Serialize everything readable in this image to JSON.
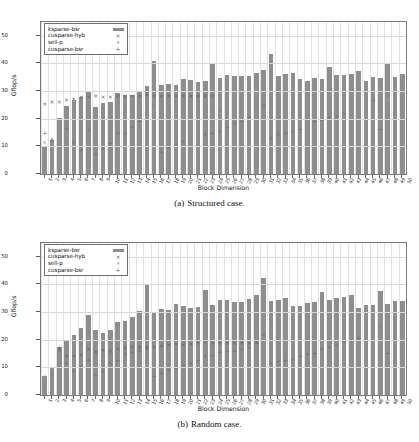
{
  "figure": {
    "panels": [
      {
        "caption_tag": "(a)",
        "caption_text": "Structured case.",
        "ylabel": "Gflop/s",
        "xlabel": "Block Dimension"
      },
      {
        "caption_tag": "(b)",
        "caption_text": "Random case.",
        "ylabel": "Gflop/s",
        "xlabel": "Block Dimension"
      }
    ],
    "legend": [
      {
        "label": "ksparse-bsr",
        "key": "bar-swatch"
      },
      {
        "label": "cusparse-hyb",
        "key": "×"
      },
      {
        "label": "sell-p",
        "key": "∗"
      },
      {
        "label": "cusparse-bsr",
        "key": "+"
      }
    ],
    "colors": {
      "bar": "#8e8e8e",
      "marker_x": "#5f5f5f",
      "marker_star": "#9b9b9b",
      "marker_plus": "#6f6f6f",
      "axis": "#7a7a7a",
      "grid": "#d8d8d8"
    }
  },
  "chart_data": [
    {
      "type": "bar",
      "title": "(a) Structured case.",
      "xlabel": "Block Dimension",
      "ylabel": "Gflop/s",
      "ylim": [
        0,
        55
      ],
      "yticks": [
        0,
        10,
        20,
        30,
        40,
        50
      ],
      "grid": true,
      "legend_position": "upper-left",
      "categories": [
        1,
        2,
        3,
        4,
        5,
        6,
        7,
        8,
        9,
        10,
        11,
        12,
        13,
        14,
        15,
        16,
        17,
        18,
        19,
        20,
        21,
        22,
        23,
        24,
        25,
        26,
        27,
        28,
        29,
        30,
        31,
        32,
        33,
        34,
        35,
        36,
        37,
        38,
        39,
        40,
        41,
        42,
        43,
        44,
        45,
        46,
        47,
        48,
        49,
        50
      ],
      "series": [
        {
          "name": "ksparse-bsr",
          "marker": "bar",
          "values": [
            9.7,
            12.3,
            20.4,
            24.5,
            26.8,
            28.0,
            30.2,
            24.4,
            25.8,
            26.0,
            29.3,
            28.5,
            28.6,
            30.0,
            32.0,
            40.8,
            32.2,
            32.5,
            32.3,
            34.2,
            34.0,
            33.2,
            33.8,
            40.0,
            34.8,
            35.8,
            35.6,
            35.3,
            35.3,
            36.7,
            37.6,
            43.4,
            35.5,
            36.3,
            36.6,
            34.2,
            33.7,
            34.8,
            34.2,
            38.9,
            35.7,
            35.9,
            36.2,
            37.1,
            33.8,
            35.0,
            34.8,
            39.8,
            35.2,
            36.2
          ]
        },
        {
          "name": "cusparse-hyb",
          "marker": "×",
          "values": [
            25.5,
            26.2,
            26.3,
            27.2,
            27.6,
            28.2,
            28.3,
            28.5,
            28.3,
            28.3,
            28.6,
            28.5,
            28.4,
            28.5,
            28.7,
            28.6,
            28.6,
            28.6,
            28.6,
            28.6,
            28.6,
            28.6,
            28.6,
            28.6,
            null,
            null,
            null,
            null,
            null,
            null,
            null,
            null,
            null,
            null,
            null,
            null,
            null,
            null,
            null,
            null,
            null,
            null,
            null,
            null,
            null,
            null,
            null,
            null,
            null,
            null
          ]
        },
        {
          "name": "sell-p",
          "marker": "∗",
          "values": [
            11.5,
            12.6,
            null,
            null,
            26.5,
            null,
            27.0,
            null,
            null,
            null,
            null,
            null,
            27.5,
            null,
            null,
            23.0,
            null,
            null,
            null,
            null,
            null,
            null,
            null,
            null,
            25.2,
            null,
            null,
            null,
            null,
            null,
            null,
            null,
            null,
            null,
            null,
            null,
            null,
            null,
            null,
            null,
            null,
            null,
            null,
            null,
            null,
            null,
            null,
            27.0,
            null,
            null
          ]
        },
        {
          "name": "cusparse-bsr",
          "marker": "+",
          "values": [
            15.2,
            12.5,
            null,
            16.8,
            12.0,
            8.8,
            16.2,
            7.6,
            9.8,
            11.6,
            15.0,
            15.3,
            17.3,
            19.3,
            null,
            null,
            8.1,
            10.0,
            11.2,
            12.3,
            null,
            null,
            14.6,
            15.0,
            16.0,
            17.3,
            18.6,
            19.3,
            20.8,
            null,
            25.2,
            13.3,
            14.6,
            15.3,
            16.0,
            16.5,
            null,
            19.4,
            19.8,
            20.8,
            21.1,
            22.2,
            null,
            null,
            null,
            26.9,
            16.5,
            null,
            null,
            null
          ]
        }
      ]
    },
    {
      "type": "bar",
      "title": "(b) Random case.",
      "xlabel": "Block Dimension",
      "ylabel": "Gflop/s",
      "ylim": [
        0,
        55
      ],
      "yticks": [
        0,
        10,
        20,
        30,
        40,
        50
      ],
      "grid": true,
      "legend_position": "upper-left",
      "categories": [
        1,
        2,
        3,
        4,
        5,
        6,
        7,
        8,
        9,
        10,
        11,
        12,
        13,
        14,
        15,
        16,
        17,
        18,
        19,
        20,
        21,
        22,
        23,
        24,
        25,
        26,
        27,
        28,
        29,
        30,
        31,
        32,
        33,
        34,
        35,
        36,
        37,
        38,
        39,
        40,
        41,
        42,
        43,
        44,
        45,
        46,
        47,
        48,
        49,
        50
      ],
      "series": [
        {
          "name": "ksparse-bsr",
          "marker": "bar",
          "values": [
            7.0,
            10.1,
            17.3,
            19.4,
            21.8,
            24.3,
            28.8,
            23.5,
            22.3,
            23.5,
            26.3,
            26.8,
            28.4,
            30.4,
            40.2,
            30.0,
            31.0,
            30.9,
            32.8,
            32.2,
            31.4,
            31.8,
            38.0,
            32.7,
            34.2,
            34.4,
            33.5,
            33.7,
            34.9,
            36.1,
            42.3,
            34.1,
            34.4,
            35.2,
            32.3,
            32.2,
            33.2,
            33.5,
            37.4,
            34.3,
            35.1,
            35.3,
            36.3,
            31.5,
            32.6,
            32.6,
            37.7,
            33.0,
            33.9,
            33.9
          ]
        },
        {
          "name": "cusparse-hyb",
          "marker": "×",
          "values": [
            null,
            null,
            16.5,
            14.4,
            14.3,
            14.7,
            17.0,
            15.8,
            16.5,
            16.3,
            17.0,
            17.3,
            17.5,
            17.7,
            17.8,
            17.7,
            17.9,
            18.3,
            18.6,
            18.5,
            18.8,
            19.2,
            19.3,
            19.0,
            19.1,
            19.1,
            19.0,
            19.0,
            19.2,
            19.4,
            null,
            null,
            null,
            null,
            null,
            null,
            null,
            null,
            null,
            null,
            null,
            null,
            null,
            null,
            null,
            null,
            null,
            null,
            null,
            null
          ]
        },
        {
          "name": "sell-p",
          "marker": "∗",
          "values": [
            6.7,
            9.7,
            null,
            null,
            null,
            null,
            null,
            null,
            null,
            null,
            null,
            null,
            null,
            null,
            21.4,
            null,
            null,
            null,
            null,
            null,
            null,
            null,
            null,
            null,
            null,
            null,
            null,
            null,
            null,
            null,
            22.7,
            null,
            null,
            null,
            null,
            null,
            null,
            null,
            null,
            null,
            null,
            null,
            null,
            null,
            null,
            null,
            25.0,
            null,
            null,
            null
          ]
        },
        {
          "name": "cusparse-bsr",
          "marker": "+",
          "values": [
            null,
            null,
            17.8,
            11.8,
            8.9,
            10.7,
            13.1,
            7.5,
            8.9,
            12.0,
            12.9,
            15.0,
            16.0,
            16.2,
            17.2,
            7.3,
            8.2,
            9.4,
            10.0,
            11.0,
            11.7,
            13.0,
            14.4,
            14.9,
            15.7,
            16.1,
            16.2,
            16.8,
            17.8,
            19.0,
            22.5,
            12.0,
            12.5,
            13.1,
            13.5,
            14.5,
            15.3,
            15.6,
            17.1,
            17.6,
            18.3,
            19.8,
            20.2,
            21.0,
            null,
            null,
            25.2,
            15.4,
            null,
            null
          ]
        }
      ]
    }
  ]
}
